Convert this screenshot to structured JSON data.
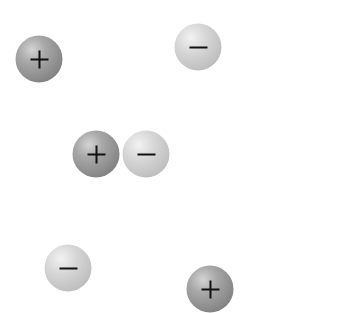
{
  "diagram": {
    "type": "electric-charges",
    "background": "#ffffff",
    "colors": {
      "positive_fill": "#8c8c8c",
      "negative_fill": "#c8c8c8",
      "sign_color": "#111111"
    },
    "charges": [
      {
        "id": "charge-1",
        "sign": "+",
        "polarity": "positive",
        "x": 39,
        "y": 59,
        "diameter": 47
      },
      {
        "id": "charge-2",
        "sign": "−",
        "polarity": "negative",
        "x": 198,
        "y": 47,
        "diameter": 47
      },
      {
        "id": "charge-3",
        "sign": "+",
        "polarity": "positive",
        "x": 96,
        "y": 154,
        "diameter": 47
      },
      {
        "id": "charge-4",
        "sign": "−",
        "polarity": "negative",
        "x": 146,
        "y": 154,
        "diameter": 47
      },
      {
        "id": "charge-5",
        "sign": "−",
        "polarity": "negative",
        "x": 68,
        "y": 268,
        "diameter": 47
      },
      {
        "id": "charge-6",
        "sign": "+",
        "polarity": "positive",
        "x": 210,
        "y": 289,
        "diameter": 47
      }
    ]
  }
}
